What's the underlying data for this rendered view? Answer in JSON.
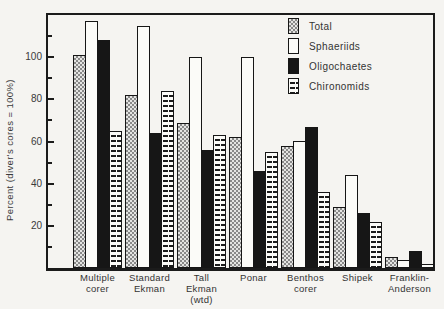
{
  "figure": {
    "background": "#f5f4f1",
    "ink": "#1b1b1b"
  },
  "chart_data": {
    "type": "bar",
    "title": "",
    "xlabel": "",
    "ylabel": "Percent (diver's cores = 100%)",
    "ylim": [
      0,
      120
    ],
    "yticks_major": [
      20,
      40,
      60,
      80,
      100
    ],
    "yticks_minor": [
      10,
      30,
      50,
      70,
      90,
      110
    ],
    "grid": false,
    "legend_position": "top-right-inside",
    "categories": [
      "Multiple\ncorer",
      "Standard\nEkman",
      "Tall\nEkman\n(wtd)",
      "Ponar",
      "Benthos\ncorer",
      "Shipek",
      "Franklin-\nAnderson"
    ],
    "series": [
      {
        "name": "Total",
        "pattern": "checker",
        "swatch_color": "#aaaaaa",
        "values": [
          101,
          82,
          69,
          62,
          58,
          29,
          5
        ]
      },
      {
        "name": "Sphaeriids",
        "pattern": "white",
        "swatch_color": "#fbfbf8",
        "values": [
          117,
          115,
          100,
          100,
          60,
          44,
          4
        ]
      },
      {
        "name": "Oligochaetes",
        "pattern": "black",
        "swatch_color": "#161616",
        "values": [
          108,
          64,
          56,
          46,
          67,
          26,
          8
        ]
      },
      {
        "name": "Chironomids",
        "pattern": "dashes",
        "swatch_color": "#fbfbf8",
        "values": [
          65,
          84,
          63,
          55,
          36,
          22,
          2
        ]
      }
    ]
  }
}
